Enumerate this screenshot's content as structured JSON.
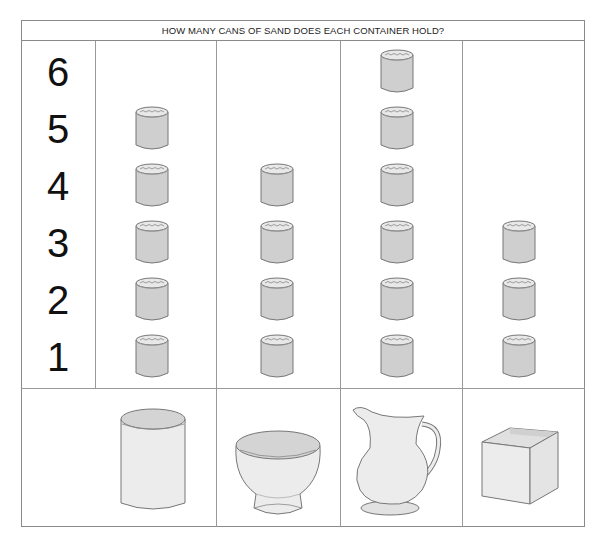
{
  "title": "HOW MANY CANS OF SAND DOES EACH CONTAINER HOLD?",
  "y_axis_numbers": [
    "6",
    "5",
    "4",
    "3",
    "2",
    "1"
  ],
  "containers": [
    {
      "name": "cylinder-jar",
      "label": "jar",
      "cans": 5
    },
    {
      "name": "bowl",
      "label": "bowl",
      "cans": 4
    },
    {
      "name": "pitcher",
      "label": "pitcher",
      "cans": 6
    },
    {
      "name": "box",
      "label": "box",
      "cans": 3
    }
  ],
  "colors": {
    "can_fill": "#cfcfcf",
    "can_outline": "#777777",
    "container_fill": "#ebebeb",
    "grid": "#999999"
  },
  "chart_data": {
    "type": "bar",
    "title": "HOW MANY CANS OF SAND DOES EACH CONTAINER HOLD?",
    "categories": [
      "jar",
      "bowl",
      "pitcher",
      "box"
    ],
    "values": [
      5,
      4,
      6,
      3
    ],
    "xlabel": "",
    "ylabel": "cans of sand",
    "ylim": [
      0,
      6
    ],
    "y_ticks": [
      1,
      2,
      3,
      4,
      5,
      6
    ],
    "grid": true,
    "legend": null
  }
}
